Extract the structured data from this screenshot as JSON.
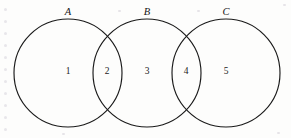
{
  "figure": {
    "type": "venn-diagram",
    "stroke_color": "#1a1a1a",
    "background_color": "#fdfdfc",
    "width": 291,
    "height": 138
  },
  "sets": [
    {
      "id": "A",
      "label": "A",
      "cx": 68,
      "cy": 73,
      "r": 54,
      "label_x": 68,
      "label_y": 12
    },
    {
      "id": "B",
      "label": "B",
      "cx": 147,
      "cy": 73,
      "r": 54,
      "label_x": 147,
      "label_y": 12
    },
    {
      "id": "C",
      "label": "C",
      "cx": 226,
      "cy": 73,
      "r": 54,
      "label_x": 226,
      "label_y": 12
    }
  ],
  "regions": [
    {
      "id": "r1",
      "label": "1",
      "x": 68,
      "y": 72,
      "meaning": "A only"
    },
    {
      "id": "r2",
      "label": "2",
      "x": 107,
      "y": 72,
      "meaning": "A and B"
    },
    {
      "id": "r3",
      "label": "3",
      "x": 147,
      "y": 72,
      "meaning": "B only"
    },
    {
      "id": "r4",
      "label": "4",
      "x": 186,
      "y": 72,
      "meaning": "B and C"
    },
    {
      "id": "r5",
      "label": "5",
      "x": 226,
      "y": 72,
      "meaning": "C only"
    }
  ],
  "speckle": {
    "margin_dots_y": [
      8,
      20,
      32,
      44,
      56,
      68,
      80,
      92,
      104,
      116,
      128
    ],
    "corner_specks": [
      {
        "x": 283,
        "y": 4
      },
      {
        "x": 118,
        "y": 10
      },
      {
        "x": 197,
        "y": 10
      },
      {
        "x": 277,
        "y": 132
      },
      {
        "x": 62,
        "y": 133
      }
    ]
  }
}
